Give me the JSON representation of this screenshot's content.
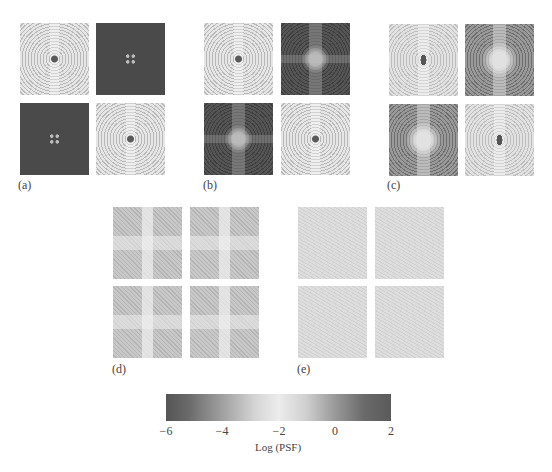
{
  "figure": {
    "panels": [
      {
        "label": "(a)",
        "tiles": [
          "concentric-rings-light",
          "dark-four-dots",
          "dark-four-dots",
          "concentric-rings-light"
        ]
      },
      {
        "label": "(b)",
        "tiles": [
          "concentric-rings-light",
          "dark-star-pattern",
          "dark-star-pattern",
          "concentric-rings-light"
        ]
      },
      {
        "label": "(c)",
        "tiles": [
          "concentric-rings-light",
          "mid-star-pattern",
          "mid-star-pattern",
          "concentric-rings-light"
        ]
      },
      {
        "label": "(d)",
        "tiles": [
          "noisy-cross",
          "noisy-cross",
          "noisy-cross",
          "noisy-cross"
        ]
      },
      {
        "label": "(e)",
        "tiles": [
          "uniform-noise",
          "uniform-noise",
          "uniform-noise",
          "uniform-noise"
        ]
      }
    ],
    "colorbar": {
      "title": "Log (PSF)",
      "ticks": [
        "−6",
        "−4",
        "−2",
        "0",
        "2"
      ],
      "range": [
        -6,
        2
      ],
      "colormap": [
        "#555555",
        "#a0a0a0",
        "#ececec",
        "#9a9a9a",
        "#5a5a5a"
      ]
    }
  }
}
